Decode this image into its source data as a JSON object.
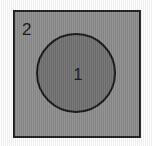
{
  "figure": {
    "type": "set-diagram",
    "background_color": "#fdfdfd",
    "shapes": [
      {
        "name": "outer-square",
        "kind": "square",
        "label": "2",
        "fill_color": "#8b8b8b",
        "stroke_color": "#1b1b1b",
        "label_position": "top-left"
      },
      {
        "name": "inner-circle",
        "kind": "circle",
        "label": "1",
        "fill_color": "#6f6f6f",
        "stroke_color": "#141414",
        "label_position": "center"
      }
    ]
  }
}
